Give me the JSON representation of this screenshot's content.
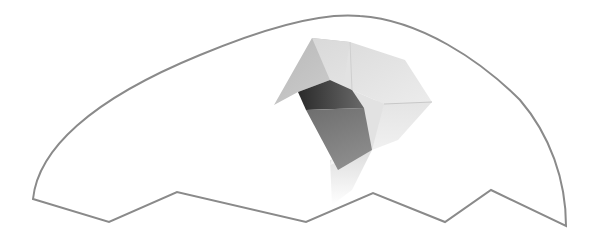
{
  "image": {
    "description": "Origami paper cube shape emerging from an outlined eggshell-like form with a zigzag bottom edge",
    "colors": {
      "background": "#ffffff",
      "outline": "#8a8a8a",
      "paper_light": "#eaeaea",
      "paper_mid": "#bdbdbd",
      "paper_dark": "#5a5a5a",
      "paper_shadow": "#2e2e2e"
    }
  }
}
